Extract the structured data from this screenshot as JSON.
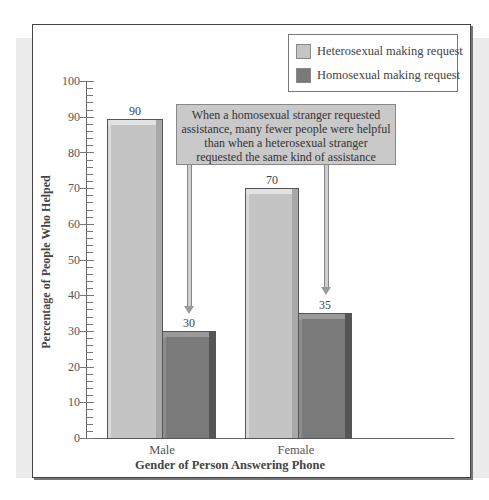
{
  "chart_data": {
    "type": "bar",
    "title": "",
    "xlabel": "Gender of Person Answering Phone",
    "ylabel": "Percentage of People Who Helped",
    "categories": [
      "Male",
      "Female"
    ],
    "series": [
      {
        "name": "Heterosexual making request",
        "values": [
          90,
          70
        ],
        "color": "#c4c4c4"
      },
      {
        "name": "Homosexual making request",
        "values": [
          30,
          35
        ],
        "color": "#7a7a7a"
      }
    ],
    "ylim": [
      0,
      100
    ],
    "yticks": [
      0,
      10,
      20,
      30,
      40,
      50,
      60,
      70,
      80,
      90,
      100
    ],
    "grid": false,
    "legend_position": "top-right",
    "annotations": [
      {
        "text": "When a homosexual stranger requested assistance, many fewer people were helpful than when a heterosexual stranger requested the same kind of assistance",
        "arrows_to": [
          "Male / Homosexual making request",
          "Female / Homosexual making request"
        ]
      }
    ],
    "data_labels": [
      "90",
      "30",
      "70",
      "35"
    ]
  },
  "legend": {
    "items": [
      {
        "label": "Heterosexual making request",
        "color": "#c4c4c4"
      },
      {
        "label": "Homosexual making request",
        "color": "#7a7a7a"
      }
    ]
  },
  "axes": {
    "y_title": "Percentage of People Who Helped",
    "x_title": "Gender of Person Answering Phone",
    "y_ticks": [
      "0",
      "10",
      "20",
      "30",
      "40",
      "50",
      "60",
      "70",
      "80",
      "90",
      "100"
    ],
    "categories": [
      "Male",
      "Female"
    ]
  },
  "bars": {
    "male_hetero": "90",
    "male_homo": "30",
    "female_hetero": "70",
    "female_homo": "35"
  },
  "callout": {
    "line1": "When a homosexual stranger requested",
    "line2": "assistance, many fewer people were helpful",
    "line3": "than when a heterosexual stranger",
    "line4": "requested the same kind of assistance"
  }
}
